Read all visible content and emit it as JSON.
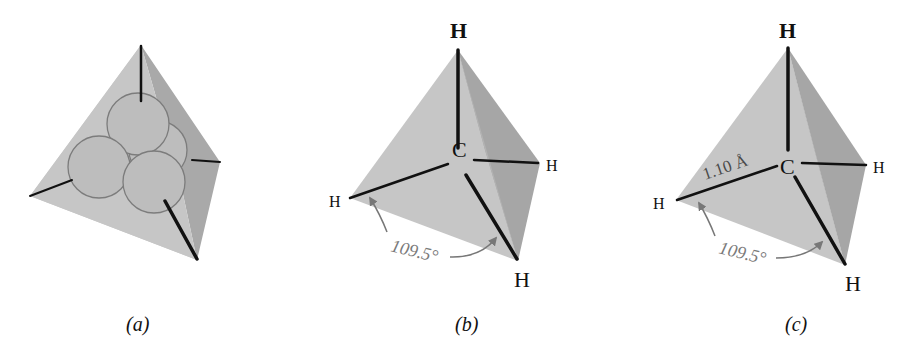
{
  "figure": {
    "panels": [
      {
        "caption": "(a)",
        "description": "Tetrahedron with four overlapping sp3 orbital spheres and four bond lines"
      },
      {
        "caption": "(b)",
        "center_atom": "C",
        "atoms": [
          "H",
          "H",
          "H",
          "H"
        ],
        "angle_label": "109.5°"
      },
      {
        "caption": "(c)",
        "center_atom": "C",
        "atoms": [
          "H",
          "H",
          "H",
          "H"
        ],
        "angle_label": "109.5°",
        "bond_length_label": "1.10 Å"
      }
    ],
    "colors": {
      "face_light": "#c4c4c4",
      "face_dark": "#a6a6a6",
      "bond": "#111111",
      "orbital_outline": "#7a7a7a",
      "annotation": "#7a7a7a"
    }
  }
}
